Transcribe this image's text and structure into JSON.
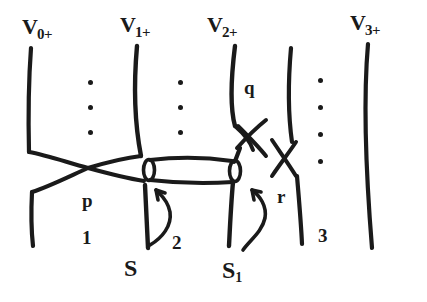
{
  "figure": {
    "kind": "hand-drawn-mathematical-diagram",
    "background_color": "#ffffff",
    "ink_color": "#1a1a1a",
    "level_labels": [
      {
        "base": "V",
        "sub": "0+",
        "x": 22,
        "y": 16
      },
      {
        "base": "V",
        "sub": "1+",
        "x": 120,
        "y": 14
      },
      {
        "base": "V",
        "sub": "2+",
        "x": 207,
        "y": 14
      },
      {
        "base": "V",
        "sub": "3+",
        "x": 350,
        "y": 12
      }
    ],
    "critical_point_labels": [
      {
        "text": "p",
        "x": 82,
        "y": 191
      },
      {
        "text": "q",
        "x": 244,
        "y": 78
      },
      {
        "text": "r",
        "x": 277,
        "y": 187
      }
    ],
    "index_labels": [
      {
        "text": "1",
        "x": 82,
        "y": 228
      },
      {
        "text": "2",
        "x": 172,
        "y": 233
      },
      {
        "text": "3",
        "x": 318,
        "y": 226
      }
    ],
    "sheet_labels": [
      {
        "base": "S",
        "sub": "",
        "x": 124,
        "y": 256
      },
      {
        "base": "S",
        "sub": "1",
        "x": 222,
        "y": 258
      }
    ],
    "dot_columns": [
      {
        "name": "dots-between-v0-v1",
        "x": 90,
        "y": 80,
        "count": 3,
        "gap": 25
      },
      {
        "name": "dots-between-v1-v2",
        "x": 180,
        "y": 80,
        "count": 3,
        "gap": 25
      },
      {
        "name": "dots-right-of-v3",
        "x": 320,
        "y": 78,
        "count": 4,
        "gap": 27
      }
    ]
  },
  "chart_data": {
    "type": "diagram",
    "title": "",
    "level_curves": [
      {
        "label": "V0+",
        "x_top": 30,
        "x_bottom": 34
      },
      {
        "label": "V1+",
        "x_top": 136,
        "x_bottom": 148
      },
      {
        "label": "V2+",
        "x_top": 234,
        "x_bottom": 230
      },
      {
        "label": "V3+",
        "x_top": 366,
        "x_bottom": 378
      },
      {
        "label": "unlabeled-inner",
        "x_top": 290,
        "x_bottom": 302
      }
    ],
    "saddles": [
      {
        "label": "p",
        "index": 1,
        "x": 88,
        "y": 167
      },
      {
        "label": "q",
        "index": 2,
        "x": 253,
        "y": 128
      },
      {
        "label": "r",
        "index": 3,
        "x": 286,
        "y": 162
      }
    ],
    "tube": {
      "from_level": "V1+",
      "to_level": "V2+",
      "left_x": 148,
      "right_x": 240,
      "y": 178
    },
    "annotations": [
      {
        "text": "S",
        "points_to": "tube-lower-edge-left"
      },
      {
        "text": "S1",
        "points_to": "tube-right-end"
      }
    ]
  }
}
